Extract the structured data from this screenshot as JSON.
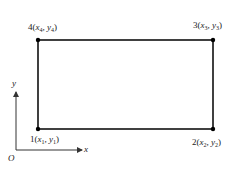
{
  "diagram": {
    "type": "quadrilateral-element",
    "nodes": [
      {
        "id": "1",
        "label_num": "1",
        "x_var": "x",
        "x_sub": "1",
        "y_var": "y",
        "y_sub": "1",
        "position": "bottom-left"
      },
      {
        "id": "2",
        "label_num": "2",
        "x_var": "x",
        "x_sub": "2",
        "y_var": "y",
        "y_sub": "2",
        "position": "bottom-right"
      },
      {
        "id": "3",
        "label_num": "3",
        "x_var": "x",
        "x_sub": "3",
        "y_var": "y",
        "y_sub": "3",
        "position": "top-right"
      },
      {
        "id": "4",
        "label_num": "4",
        "x_var": "x",
        "x_sub": "4",
        "y_var": "y",
        "y_sub": "4",
        "position": "top-left"
      }
    ],
    "axes": {
      "origin_label": "O",
      "x_label": "x",
      "y_label": "y"
    },
    "colors": {
      "line": "#111111",
      "axis": "#333333",
      "text": "#222222"
    }
  }
}
